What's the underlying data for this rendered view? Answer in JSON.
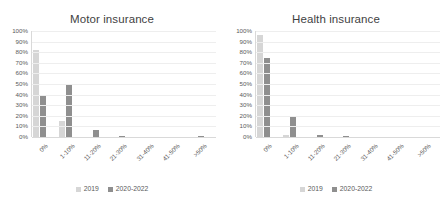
{
  "chart_data": [
    {
      "type": "bar",
      "title": "Motor insurance",
      "xlabel": "",
      "ylabel": "",
      "ylim": [
        0,
        100
      ],
      "ytick_labels": [
        "100%",
        "90%",
        "80%",
        "70%",
        "60%",
        "50%",
        "40%",
        "30%",
        "20%",
        "10%",
        "0%"
      ],
      "ytick_values": [
        100,
        90,
        80,
        70,
        60,
        50,
        40,
        30,
        20,
        10,
        0
      ],
      "grid": true,
      "legend_position": "bottom",
      "categories": [
        "0%",
        "1-10%",
        "11-20%",
        "21-30%",
        "31-40%",
        "41-50%",
        ">50%"
      ],
      "series": [
        {
          "name": "2019",
          "color": "#d6d6d6",
          "values": [
            82,
            15,
            0,
            0,
            0,
            0,
            0
          ]
        },
        {
          "name": "2020-2022",
          "color": "#8f8f8f",
          "values": [
            40,
            50,
            7,
            0.7,
            0,
            0,
            0.5
          ]
        }
      ]
    },
    {
      "type": "bar",
      "title": "Health insurance",
      "xlabel": "",
      "ylabel": "",
      "ylim": [
        0,
        100
      ],
      "ytick_labels": [
        "100%",
        "90%",
        "80%",
        "70%",
        "60%",
        "50%",
        "40%",
        "30%",
        "20%",
        "10%",
        "0%"
      ],
      "ytick_values": [
        100,
        90,
        80,
        70,
        60,
        50,
        40,
        30,
        20,
        10,
        0
      ],
      "grid": true,
      "legend_position": "bottom",
      "categories": [
        "0%",
        "1-10%",
        "11-20%",
        "21-30%",
        "31-40%",
        "41-50%",
        ">50%"
      ],
      "series": [
        {
          "name": "2019",
          "color": "#d6d6d6",
          "values": [
            96,
            1.5,
            0,
            0,
            0,
            0,
            0
          ]
        },
        {
          "name": "2020-2022",
          "color": "#8f8f8f",
          "values": [
            75,
            20,
            1.5,
            1,
            0,
            0,
            0
          ]
        }
      ]
    }
  ]
}
